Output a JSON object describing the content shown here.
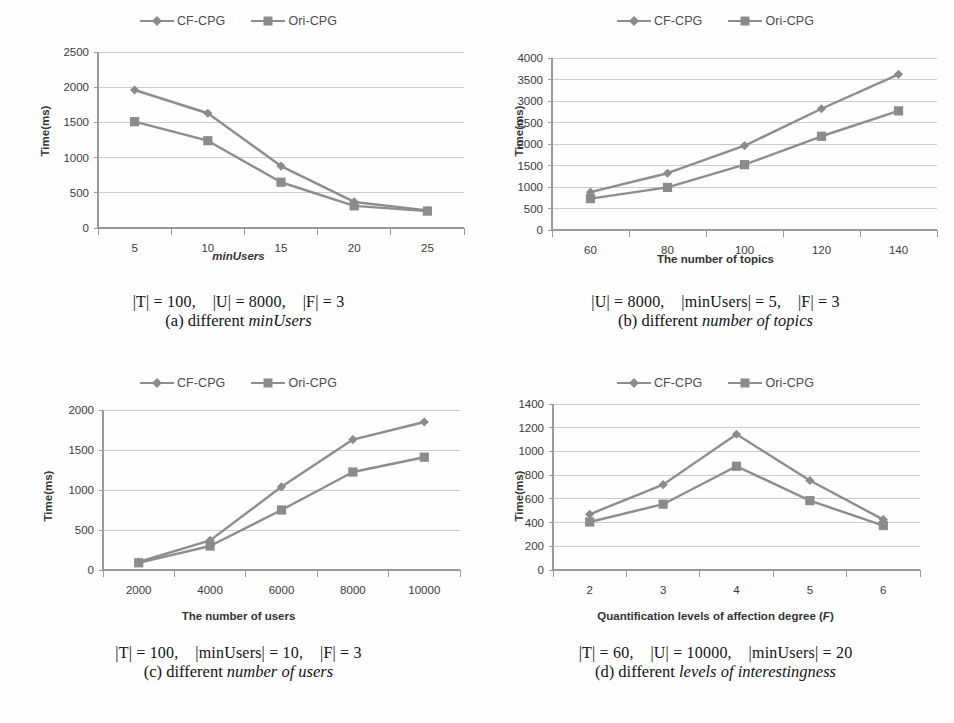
{
  "figure": {
    "series_names": [
      "CF-CPG",
      "Ori-CPG"
    ],
    "colors": {
      "line": "#8d8d8d",
      "marker": "#8b8b8b",
      "grid": "#bfbfbf",
      "axis": "#9a9a9a"
    },
    "ylabel": "Time(ms)"
  },
  "panels": {
    "a": {
      "xlabel": "minUsers",
      "caption_params": "|T| = 100,    |U| = 8000,    |F| = 3",
      "caption_prefix": "(a) different ",
      "caption_emphasis": "minUsers"
    },
    "b": {
      "xlabel": "The number of topics",
      "caption_params": "|U| = 8000,    |minUsers| = 5,    |F| = 3",
      "caption_prefix": "(b) different ",
      "caption_emphasis": "number of topics"
    },
    "c": {
      "xlabel": "The number of users",
      "caption_params": "|T| = 100,    |minUsers| = 10,    |F| = 3",
      "caption_prefix": "(c) different ",
      "caption_emphasis": "number of users"
    },
    "d": {
      "xlabel_main": "Quantification levels of affection degree (",
      "xlabel_italic": "F",
      "xlabel_tail": ")",
      "caption_params": "|T| = 60,    |U| = 10000,    |minUsers| = 20",
      "caption_prefix": "(d) different ",
      "caption_emphasis": "levels of interestingness"
    }
  },
  "chart_data": [
    {
      "id": "a",
      "type": "line",
      "title": "(a) different minUsers",
      "xlabel": "minUsers",
      "ylabel": "Time(ms)",
      "categories": [
        "5",
        "10",
        "15",
        "20",
        "25"
      ],
      "x": [
        5,
        10,
        15,
        20,
        25
      ],
      "ylim": [
        0,
        2500
      ],
      "yticks": [
        0,
        500,
        1000,
        1500,
        2000,
        2500
      ],
      "grid": true,
      "legend": "top-center",
      "series": [
        {
          "name": "CF-CPG",
          "marker": "diamond",
          "values": [
            1960,
            1630,
            880,
            370,
            250
          ]
        },
        {
          "name": "Ori-CPG",
          "marker": "square",
          "values": [
            1510,
            1240,
            650,
            315,
            240
          ]
        }
      ]
    },
    {
      "id": "b",
      "type": "line",
      "title": "(b) different number of topics",
      "xlabel": "The number of topics",
      "ylabel": "Time(ms)",
      "categories": [
        "60",
        "80",
        "100",
        "120",
        "140"
      ],
      "x": [
        60,
        80,
        100,
        120,
        140
      ],
      "ylim": [
        0,
        4000
      ],
      "yticks": [
        0,
        500,
        1000,
        1500,
        2000,
        2500,
        3000,
        3500,
        4000
      ],
      "grid": true,
      "legend": "top-center",
      "series": [
        {
          "name": "CF-CPG",
          "marker": "diamond",
          "values": [
            880,
            1320,
            1960,
            2820,
            3620
          ]
        },
        {
          "name": "Ori-CPG",
          "marker": "square",
          "values": [
            730,
            990,
            1520,
            2180,
            2770
          ]
        }
      ]
    },
    {
      "id": "c",
      "type": "line",
      "title": "(c) different number of users",
      "xlabel": "The number of users",
      "ylabel": "Time(ms)",
      "categories": [
        "2000",
        "4000",
        "6000",
        "8000",
        "10000"
      ],
      "x": [
        2000,
        4000,
        6000,
        8000,
        10000
      ],
      "ylim": [
        0,
        2000
      ],
      "yticks": [
        0,
        500,
        1000,
        1500,
        2000
      ],
      "grid": true,
      "legend": "top-center",
      "series": [
        {
          "name": "CF-CPG",
          "marker": "diamond",
          "values": [
            100,
            370,
            1040,
            1630,
            1850
          ]
        },
        {
          "name": "Ori-CPG",
          "marker": "square",
          "values": [
            90,
            300,
            750,
            1225,
            1410
          ]
        }
      ]
    },
    {
      "id": "d",
      "type": "line",
      "title": "(d) different levels of interestingness",
      "xlabel": "Quantification levels of affection degree (F)",
      "ylabel": "Time(ms)",
      "categories": [
        "2",
        "3",
        "4",
        "5",
        "6"
      ],
      "x": [
        2,
        3,
        4,
        5,
        6
      ],
      "ylim": [
        0,
        1400
      ],
      "yticks": [
        0,
        200,
        400,
        600,
        800,
        1000,
        1200,
        1400
      ],
      "grid": true,
      "legend": "top-center",
      "series": [
        {
          "name": "CF-CPG",
          "marker": "diamond",
          "values": [
            470,
            720,
            1145,
            755,
            425
          ]
        },
        {
          "name": "Ori-CPG",
          "marker": "square",
          "values": [
            405,
            555,
            875,
            585,
            375
          ]
        }
      ]
    }
  ]
}
